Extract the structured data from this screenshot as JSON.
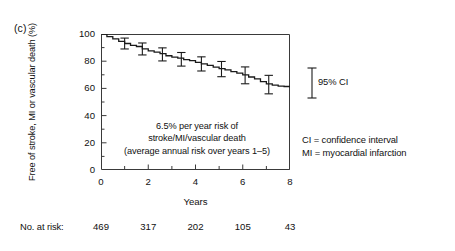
{
  "figure": {
    "panel_label": "(c)",
    "xlabel": "Years",
    "ylabel": "Free of stroke, MI or vascular death (%)",
    "annotation_line1": "6.5% per year risk of",
    "annotation_line2": "stroke/MI/vascular death",
    "annotation_line3": "(average annual risk over years 1–5)",
    "ci_legend": "95% CI",
    "abbrev_line1": "CI = confidence interval",
    "abbrev_line2": "MI = myocardial infarction",
    "risk_label": "No. at risk:",
    "line_color": "#1a1a1a",
    "axis_color": "#3a3a3a"
  },
  "chart_data": {
    "type": "line",
    "title": "",
    "xlabel": "Years",
    "ylabel": "Free of stroke, MI or vascular death (%)",
    "xlim": [
      0,
      8
    ],
    "ylim": [
      0,
      100
    ],
    "xticks": [
      0,
      2,
      4,
      6,
      8
    ],
    "xticks_minor": [
      1,
      3,
      5,
      7
    ],
    "yticks": [
      0,
      20,
      40,
      60,
      80,
      100
    ],
    "yticks_minor": [
      10,
      30,
      50,
      70,
      90
    ],
    "grid": false,
    "legend": "none",
    "series": [
      {
        "name": "Free of stroke, MI or vascular death",
        "x": [
          0.0,
          0.25,
          0.5,
          0.75,
          1.0,
          1.25,
          1.5,
          1.75,
          2.0,
          2.25,
          2.5,
          2.75,
          3.0,
          3.25,
          3.5,
          3.75,
          4.0,
          4.25,
          4.5,
          4.75,
          5.0,
          5.25,
          5.5,
          5.75,
          6.0,
          6.25,
          6.5,
          6.75,
          7.0,
          7.25,
          7.5,
          7.75,
          8.0
        ],
        "y": [
          100.0,
          98.0,
          96.4,
          94.6,
          93.0,
          91.6,
          90.8,
          89.0,
          87.6,
          86.6,
          85.6,
          84.0,
          83.0,
          82.2,
          81.2,
          80.4,
          79.2,
          78.0,
          77.0,
          75.6,
          74.6,
          73.6,
          72.4,
          71.2,
          70.0,
          68.4,
          67.0,
          65.0,
          63.4,
          62.4,
          61.6,
          61.4,
          61.4
        ]
      }
    ],
    "error_bars": [
      {
        "x": 1.0,
        "y": 93.0,
        "lower": 89.0,
        "upper": 97.0
      },
      {
        "x": 1.75,
        "y": 89.0,
        "lower": 84.6,
        "upper": 93.4
      },
      {
        "x": 2.6,
        "y": 85.0,
        "lower": 80.2,
        "upper": 89.8
      },
      {
        "x": 3.4,
        "y": 81.4,
        "lower": 76.4,
        "upper": 86.4
      },
      {
        "x": 4.25,
        "y": 78.0,
        "lower": 72.8,
        "upper": 83.2
      },
      {
        "x": 5.1,
        "y": 74.2,
        "lower": 68.6,
        "upper": 79.8
      },
      {
        "x": 6.1,
        "y": 69.6,
        "lower": 63.4,
        "upper": 75.8
      },
      {
        "x": 7.1,
        "y": 62.8,
        "lower": 56.0,
        "upper": 69.6
      }
    ],
    "ci_reference_bar": {
      "label": "95% CI",
      "center": 66.0,
      "lower": 59.5,
      "upper": 72.5
    },
    "annotations": [
      "6.5% per year risk of",
      "stroke/MI/vascular death",
      "(average annual risk over years 1–5)"
    ],
    "at_risk": {
      "label": "No. at risk:",
      "x": [
        0,
        2,
        4,
        6,
        8
      ],
      "values": [
        469,
        317,
        202,
        105,
        43
      ]
    }
  }
}
